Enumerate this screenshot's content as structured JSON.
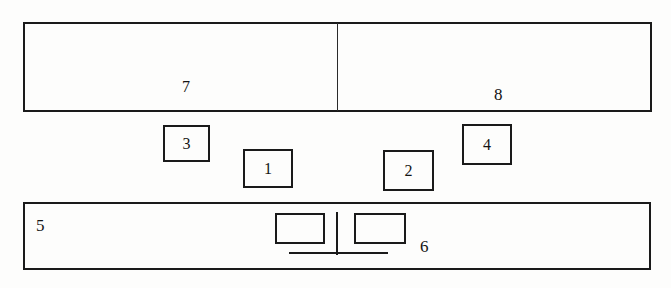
{
  "diagram": {
    "style": {
      "line_color": "#1a1a1a",
      "background": "#fdfdfc",
      "text_color": "#141414"
    },
    "parts": [
      {
        "id": "part-7",
        "label": "7",
        "shape": "rectangle",
        "role": "left-half-of-top-bar"
      },
      {
        "id": "part-8",
        "label": "8",
        "shape": "rectangle",
        "role": "right-half-of-top-bar"
      },
      {
        "id": "part-3",
        "label": "3",
        "shape": "small-rectangle",
        "role": "upper-left-block"
      },
      {
        "id": "part-1",
        "label": "1",
        "shape": "small-rectangle",
        "role": "lower-left-block"
      },
      {
        "id": "part-2",
        "label": "2",
        "shape": "small-rectangle",
        "role": "lower-right-block"
      },
      {
        "id": "part-4",
        "label": "4",
        "shape": "small-rectangle",
        "role": "upper-right-block"
      },
      {
        "id": "part-5",
        "label": "5",
        "shape": "rectangle",
        "role": "bottom-bar"
      },
      {
        "id": "part-6",
        "label": "6",
        "shape": "pedestal-assembly",
        "role": "detail-inside-bottom-bar"
      }
    ],
    "labels": {
      "seven": "7",
      "eight": "8",
      "three": "3",
      "one": "1",
      "two": "2",
      "four": "4",
      "five": "5",
      "six": "6"
    }
  }
}
